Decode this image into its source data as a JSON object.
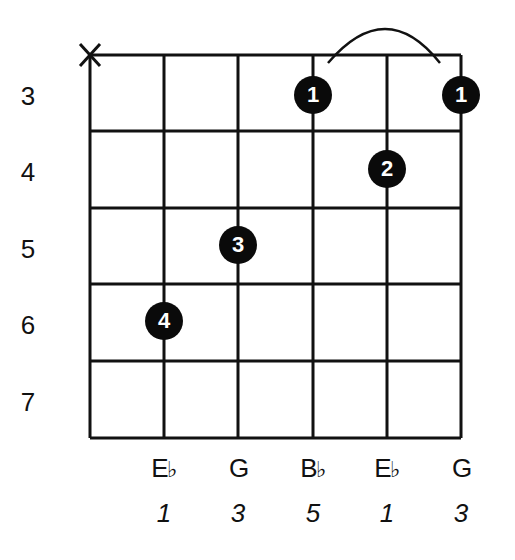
{
  "diagram": {
    "type": "guitar-chord-chart",
    "chord_notes_display": "Eb major (barre shape)",
    "strings": 6,
    "fret_range": [
      3,
      7
    ],
    "fret_labels": [
      "3",
      "4",
      "5",
      "6",
      "7"
    ],
    "open_muted": [
      {
        "string": 6,
        "symbol": "X"
      }
    ],
    "fingers": [
      {
        "string": 3,
        "fret": 3,
        "finger": "1"
      },
      {
        "string": 1,
        "fret": 3,
        "finger": "1"
      },
      {
        "string": 2,
        "fret": 4,
        "finger": "2"
      },
      {
        "string": 4,
        "fret": 5,
        "finger": "3"
      },
      {
        "string": 5,
        "fret": 6,
        "finger": "4"
      }
    ],
    "barre": {
      "from_string": 3,
      "to_string": 1,
      "fret": 3
    },
    "note_names": [
      {
        "letter": "E",
        "accidental": "♭"
      },
      {
        "letter": "G",
        "accidental": ""
      },
      {
        "letter": "B",
        "accidental": "♭"
      },
      {
        "letter": "E",
        "accidental": "♭"
      },
      {
        "letter": "G",
        "accidental": ""
      }
    ],
    "intervals": [
      "1",
      "3",
      "5",
      "1",
      "3"
    ],
    "colors": {
      "line": "#111111",
      "dot": "#0a0a0a",
      "dot_text": "#ffffff",
      "background": "#ffffff"
    }
  }
}
